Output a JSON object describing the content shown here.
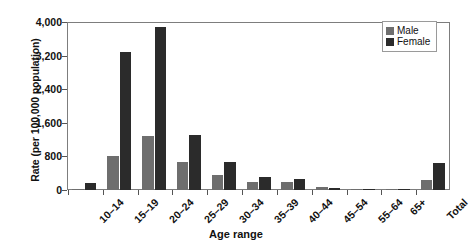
{
  "chart_data": {
    "type": "bar",
    "title": "",
    "xlabel": "Age range",
    "ylabel": "Rate (per 100,000 population)",
    "categories": [
      "10–14",
      "15–19",
      "20–24",
      "25–29",
      "30–34",
      "35–39",
      "40–44",
      "45–54",
      "55–64",
      "65+",
      "Total"
    ],
    "series": [
      {
        "name": "Male",
        "color": "#6e6e6e",
        "values": [
          20,
          815,
          1290,
          660,
          350,
          180,
          195,
          60,
          15,
          8,
          245
        ]
      },
      {
        "name": "Female",
        "color": "#2b2b2b",
        "values": [
          160,
          3290,
          3870,
          1300,
          660,
          300,
          260,
          45,
          12,
          5,
          655
        ]
      }
    ],
    "ylim": [
      0,
      4000
    ],
    "yticks": [
      0,
      800,
      1600,
      2400,
      3200,
      4000
    ],
    "ytick_labels": [
      "0",
      "800",
      "1,600",
      "2,400",
      "3,200",
      "4,000"
    ],
    "grid": false,
    "legend_position": "top-right",
    "legend_entries": [
      "Male",
      "Female"
    ]
  }
}
